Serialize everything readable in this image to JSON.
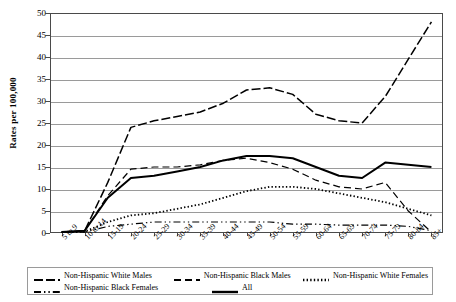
{
  "chart_data": {
    "type": "line",
    "title": "",
    "xlabel": "",
    "ylabel": "Rates per 100,000",
    "ylim": [
      0,
      50
    ],
    "ytick_step": 5,
    "grid": true,
    "legend_position": "bottom",
    "categories": [
      "5 to 9",
      "10 to 14",
      "15-19",
      "20-24",
      "25-29",
      "30-34",
      "35-39",
      "40-44",
      "45-49",
      "50-54",
      "55-59",
      "60-64",
      "65-69",
      "70-74",
      "75-79",
      "80-84",
      "85+"
    ],
    "yticks": [
      "0",
      "5",
      "10",
      "15",
      "20",
      "25",
      "30",
      "35",
      "40",
      "45",
      "50"
    ],
    "series": [
      {
        "name": "Non-Hispanic White Males",
        "dash": "long-dash-dot",
        "values": [
          0.2,
          0.5,
          11.5,
          24.0,
          25.5,
          26.5,
          27.5,
          29.5,
          32.5,
          33.0,
          31.5,
          27.0,
          25.5,
          25.0,
          31.0,
          39.5,
          48.0
        ]
      },
      {
        "name": "Non-Hispanic Black Males",
        "dash": "dash",
        "values": [
          0.2,
          0.5,
          8.5,
          14.5,
          15.0,
          15.0,
          15.5,
          16.5,
          17.0,
          16.0,
          14.5,
          12.0,
          10.5,
          10.0,
          11.5,
          5.0,
          0.2
        ]
      },
      {
        "name": "Non-Hispanic White Females",
        "dash": "dotted",
        "values": [
          0.1,
          0.3,
          2.5,
          4.0,
          4.5,
          5.5,
          6.5,
          8.0,
          9.5,
          10.5,
          10.5,
          10.0,
          9.0,
          8.0,
          7.0,
          5.5,
          4.0
        ]
      },
      {
        "name": "Non-Hispanic Black Females",
        "dash": "dash-dot-dot",
        "values": [
          0.1,
          0.2,
          1.5,
          2.0,
          2.5,
          2.5,
          2.5,
          2.5,
          2.5,
          2.5,
          2.0,
          2.0,
          1.8,
          1.8,
          1.8,
          1.5,
          0.5
        ]
      },
      {
        "name": "All",
        "dash": "solid",
        "values": [
          0.2,
          0.5,
          8.0,
          12.5,
          13.0,
          14.0,
          15.0,
          16.5,
          17.5,
          17.5,
          17.0,
          15.0,
          13.0,
          12.5,
          16.0,
          15.5,
          15.0
        ]
      }
    ]
  },
  "legend": {
    "entries": [
      {
        "label": "Non-Hispanic White Males"
      },
      {
        "label": "Non-Hispanic Black Males"
      },
      {
        "label": "Non-Hispanic White Females"
      },
      {
        "label": "Non-Hispanic Black Females"
      },
      {
        "label": "All"
      }
    ]
  },
  "colors": {
    "ink": "#000000",
    "grid": "#9a9a9a",
    "frame": "#4a4a4a"
  }
}
